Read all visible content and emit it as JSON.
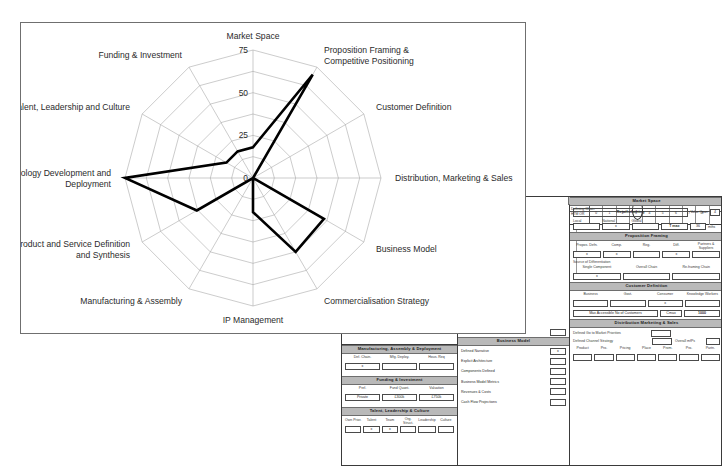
{
  "chart_data": {
    "type": "radar",
    "title": "",
    "categories": [
      "Market Space",
      "Proposition Framing & Competitive Positioning",
      "Customer Definition",
      "Distribution, Marketing & Sales",
      "Business Model",
      "Commercialisation Strategy",
      "IP Management",
      "Manufacturing & Assembly",
      "Product and Service Definition and Synthesis",
      "Technology Development and Deployment",
      "Talent, Leadership and Culture",
      "Funding & Investment"
    ],
    "values": [
      18,
      70,
      0,
      0,
      48,
      50,
      20,
      0,
      38,
      75,
      18,
      18
    ],
    "tick_labels": [
      "0",
      "25",
      "50",
      "75"
    ],
    "tick_values": [
      0,
      25,
      50,
      75
    ],
    "rmin": 0,
    "rmax": 75,
    "rings": 6,
    "grid": true,
    "legend": "none",
    "series_color": "#000000",
    "grid_color": "#a9a9a9"
  },
  "form": {
    "location_strip": {
      "caption_top": "Chosen Location",
      "caption_bottom": "HTM OR",
      "ticks": [
        "0",
        "1",
        "2",
        "3",
        "4",
        "5",
        "6",
        "7",
        "8",
        "9"
      ],
      "marks": [
        "",
        "",
        "",
        "",
        "1",
        "",
        "",
        "x",
        "",
        "x"
      ]
    },
    "market_space": {
      "header": "Market Space",
      "value": "Retail-clothing",
      "value_quant_label": "Value Quan",
      "value_quant": "4",
      "scope_labels": [
        "Local",
        "National",
        "Global"
      ],
      "scope_marks": [
        "",
        "x",
        ""
      ],
      "tmax_label": "T max",
      "tmax_value": "36",
      "tmax_unit": "mths"
    },
    "proposition_framing": {
      "header": "Proposition Framing",
      "labels": [
        "Propos. Defn.",
        "Comp.",
        "Reg.",
        "Diff.",
        "Partners & Suppliers"
      ],
      "marks": [
        "x",
        "x",
        "",
        "x",
        ""
      ],
      "sub_label": "Source of Differentiation",
      "sub_items": [
        "Single Component",
        "Overall Chain",
        "Re-framing Chain"
      ],
      "sub_marks": [
        "x",
        "",
        ""
      ]
    },
    "customer_definition": {
      "header": "Customer Definition",
      "labels": [
        "Business",
        "Govt.",
        "Consumer",
        "Knowledge Workers"
      ],
      "marks": [
        "",
        "",
        "x",
        ""
      ],
      "max_label": "Max Accessible No of Customers",
      "cmax_label": "Cmax",
      "cmax_value": "1000"
    },
    "distribution": {
      "header": "Distribution Marketing & Sales",
      "row1_label": "Defined Go to Market Priorities",
      "row1_mark": "",
      "row2_label": "Defined Channel Strategy",
      "row2_mark": "",
      "row3_label": "Overall mfPs",
      "row3_mark": "",
      "p_labels": [
        "Product",
        "Pro.",
        "Pricing",
        "Place",
        "Prom.",
        "Pro.",
        "Partn."
      ],
      "p_marks": [
        "",
        "",
        "",
        "",
        "",
        "",
        ""
      ]
    },
    "strategy_panel": {
      "header": "Commercialisation Strategy",
      "note": "Defining Chain"
    },
    "strategic_gap": {
      "label": "Strategic Gap Clarity?",
      "mark": ""
    },
    "business_model": {
      "header": "Business Model",
      "rows": [
        {
          "label": "Defined Narrative",
          "mark": "x"
        },
        {
          "label": "Explicit Architecture",
          "mark": ""
        },
        {
          "label": "Components Defined",
          "mark": ""
        },
        {
          "label": "Business Model Metrics",
          "mark": ""
        },
        {
          "label": "Revenues & Costs",
          "mark": ""
        },
        {
          "label": "Cash Flow Projections",
          "mark": ""
        }
      ]
    },
    "manufacturing": {
      "header": "Manufacturing, Assembly & Deployment",
      "labels": [
        "Def. Chain.",
        "Mfg. Deploy.",
        "Hous. Req"
      ],
      "marks": [
        "x",
        "",
        ""
      ]
    },
    "funding": {
      "header": "Funding & Investment",
      "labels": [
        "Pref.",
        "Fund Quant.",
        "Valuation"
      ],
      "values": [
        "Private",
        "£300k",
        "£750k"
      ]
    },
    "talent": {
      "header": "Talent, Leadership & Culture",
      "labels": [
        "Own Prior.",
        "Talent",
        "Team",
        "Org. Struct.",
        "Leadership",
        "Culture"
      ],
      "marks": [
        "",
        "x",
        "x",
        "",
        "",
        ""
      ]
    }
  }
}
